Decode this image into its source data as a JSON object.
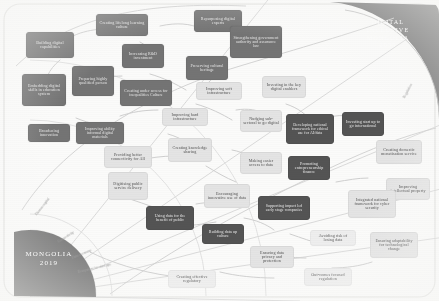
{
  "diagram": {
    "colors": {
      "dark_node": "#6f6f6f",
      "darker_node": "#4e4e4e",
      "light_node": "#e4e4e4",
      "arc_fill": "#6e6e6e",
      "background": "#fbfbfa",
      "connector": "#c9c9c9"
    },
    "origin": {
      "label_line1": "MONGOLIA",
      "label_line2": "2019"
    },
    "destination": {
      "label_line1": "DIGITAL",
      "label_line2": "INCLUSIVE",
      "label_line3": "MONGOLIA",
      "label_line4": "2035"
    },
    "spokes": [
      {
        "id": "human-capital",
        "label": "Human capital"
      },
      {
        "id": "connectivity",
        "label": "Connectivity"
      },
      {
        "id": "data-economy",
        "label": "Data economy"
      },
      {
        "id": "ecosystem-start-ups",
        "label": "Ecosystem for start ups"
      },
      {
        "id": "regulation",
        "label": "Regulation"
      }
    ],
    "nodes": [
      {
        "id": "building-digital-capabilities",
        "label": "Building digital capabilities",
        "style": "dark"
      },
      {
        "id": "creating-lifelong-learning-culture",
        "label": "Creating lifelong learning culture",
        "style": "dark"
      },
      {
        "id": "repurposing-digital-experts",
        "label": "Repurposing digital experts",
        "style": "dark"
      },
      {
        "id": "increasing-rd-investment",
        "label": "Increasing R&D investment",
        "style": "dark"
      },
      {
        "id": "strengthening-government-authority",
        "label": "Strengthening government authority and assurance law",
        "style": "dark"
      },
      {
        "id": "embedding-digital-skills",
        "label": "Embedding digital skills in education system",
        "style": "dark"
      },
      {
        "id": "preparing-highly-qualified-person",
        "label": "Preparing highly qualified person",
        "style": "dark"
      },
      {
        "id": "preserving-cultural-heritage",
        "label": "Preserving cultural heritage",
        "style": "dark"
      },
      {
        "id": "creating-under-access-inequalities-culture",
        "label": "Creating under access for inequalities Culture",
        "style": "dark"
      },
      {
        "id": "improving-soft-infrastructure",
        "label": "Improving soft infrastructure",
        "style": "light"
      },
      {
        "id": "investing-key-digital-enablers",
        "label": "Investing in the key digital enablers",
        "style": "light"
      },
      {
        "id": "broadening-innovation",
        "label": "Broadening innovation",
        "style": "dark"
      },
      {
        "id": "improving-ability-informal-digital-materials",
        "label": "Improving ability informal digital materials",
        "style": "dark"
      },
      {
        "id": "improving-hard-infrastructure",
        "label": "Improving hard infrastructure",
        "style": "light"
      },
      {
        "id": "nudging-sub-sectoral-to-go-digital",
        "label": "Nudging sub-sectoral to go digital",
        "style": "light"
      },
      {
        "id": "developing-national-framework-ethical-ai",
        "label": "Developing national framework for ethical use for AI/data",
        "style": "darker"
      },
      {
        "id": "investing-start-up-international",
        "label": "Investing start up to go international",
        "style": "darker"
      },
      {
        "id": "creating-domestic-monetisation-service",
        "label": "Creating domestic monetisation service",
        "style": "light"
      },
      {
        "id": "providing-better-connectivity-for-all",
        "label": "Providing better connectivity for All",
        "style": "light"
      },
      {
        "id": "creating-knowledge-sharing",
        "label": "Creating knowledge sharing",
        "style": "light"
      },
      {
        "id": "making-easier-access-to-data",
        "label": "Making easier access to data",
        "style": "light"
      },
      {
        "id": "promoting-entrepreneurship-finance",
        "label": "Promoting entrepreneurship finance",
        "style": "darker"
      },
      {
        "id": "improving-intellectual-property",
        "label": "Improving intellectual property",
        "style": "light"
      },
      {
        "id": "digitising-public-service-delivery",
        "label": "Digitising public service delivery",
        "style": "light"
      },
      {
        "id": "encouraging-innovative-use-of-data",
        "label": "Encouraging innovative use of data",
        "style": "light"
      },
      {
        "id": "integrated-national-framework-cyber-security",
        "label": "Integrated national framework for cyber security",
        "style": "light"
      },
      {
        "id": "using-data-for-benefit-of-public",
        "label": "Using data for the benefit of public",
        "style": "darker"
      },
      {
        "id": "building-data-up-culture",
        "label": "Building data up culture",
        "style": "darker"
      },
      {
        "id": "supporting-impact-led-early-stage-companies",
        "label": "Supporting impact led early stage companies",
        "style": "darker"
      },
      {
        "id": "avoiding-risk-of-losing-data",
        "label": "Avoiding risk of losing data",
        "style": "pale"
      },
      {
        "id": "ensuring-adaptability-for-technological-change",
        "label": "Ensuring adaptability for technological change",
        "style": "light"
      },
      {
        "id": "ensuring-data-privacy-and-protection",
        "label": "Ensuring data privacy and protection",
        "style": "light"
      },
      {
        "id": "creating-effective-regulatory",
        "label": "Creating effective regulatory",
        "style": "pale"
      },
      {
        "id": "out-comes-focused-regulation",
        "label": "Out-comes focused regulation",
        "style": "pale"
      }
    ]
  }
}
